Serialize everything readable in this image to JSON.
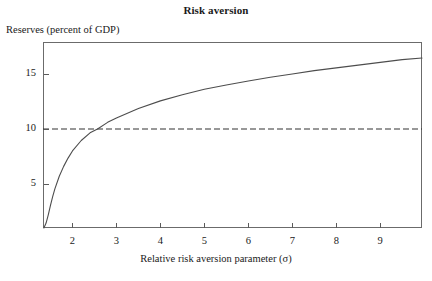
{
  "chart_data": {
    "type": "line",
    "title": "Risk aversion",
    "xlabel": "Relative risk aversion parameter (σ)",
    "ylabel": "Reserves (percent of GDP)",
    "xlim": [
      1.33,
      9.95
    ],
    "ylim": [
      1.0,
      17.9
    ],
    "grid": false,
    "legend": null,
    "xticks": [
      2,
      3,
      4,
      5,
      6,
      7,
      8,
      9
    ],
    "xtick_labels": [
      "2",
      "3",
      "4",
      "5",
      "6",
      "7",
      "8",
      "9"
    ],
    "yticks": [
      5,
      10,
      15
    ],
    "ytick_labels": [
      "5",
      "10",
      "15"
    ],
    "series": [
      {
        "name": "Optimal reserves",
        "style": "solid",
        "color": "#4d4d4d",
        "x": [
          1.35,
          1.4,
          1.45,
          1.5,
          1.55,
          1.6,
          1.7,
          1.8,
          1.9,
          2.0,
          2.2,
          2.4,
          2.57,
          2.8,
          3.0,
          3.5,
          4.0,
          4.5,
          5.0,
          5.5,
          6.0,
          6.5,
          7.0,
          7.5,
          8.0,
          8.5,
          9.0,
          9.5,
          9.95
        ],
        "y": [
          1.0,
          1.45,
          2.2,
          3.05,
          3.85,
          4.55,
          5.7,
          6.6,
          7.35,
          8.0,
          8.95,
          9.65,
          10.0,
          10.6,
          11.0,
          11.85,
          12.55,
          13.1,
          13.6,
          14.0,
          14.35,
          14.7,
          15.0,
          15.3,
          15.55,
          15.8,
          16.05,
          16.3,
          16.45
        ]
      },
      {
        "name": "Reference level",
        "style": "dashed",
        "color": "#333333",
        "y_constant": 10,
        "x": [
          1.33,
          9.95
        ]
      }
    ],
    "annotations": []
  },
  "figure": {
    "title": "Risk aversion",
    "ylabel": "Reserves (percent of GDP)",
    "xlabel": "Relative risk aversion parameter (σ)"
  },
  "colors": {
    "curve": "#4d4d4d",
    "dashed": "#333333",
    "frame": "#6b6b6b",
    "background": "#ffffff",
    "text": "#1a1a1a"
  }
}
